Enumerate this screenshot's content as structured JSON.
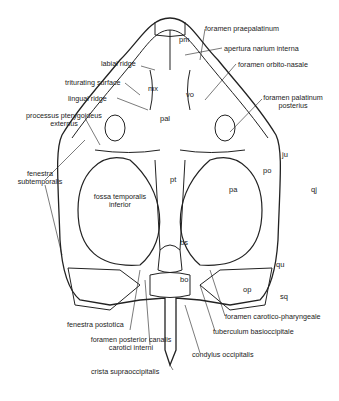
{
  "figure": {
    "labels_left": {
      "labial_ridge": "labial ridge",
      "triturating_surface": "triturating surface",
      "lingual_ridge": "lingual ridge",
      "processus_pterygoideus_1": "processus pterygoideus",
      "processus_pterygoideus_2": "externus",
      "fenestra_subtemporalis_1": "fenestra",
      "fenestra_subtemporalis_2": "subtemporalis",
      "fossa_temporalis_1": "fossa temporalis",
      "fossa_temporalis_2": "inferior",
      "fenestra_postotica": "fenestra postotica",
      "foramen_posterior_1": "foramen posterior canalis",
      "foramen_posterior_2": "carotici interni",
      "crista_supraoccipitalis": "crista supraoccipitalis"
    },
    "labels_right": {
      "foramen_praepalatinum": "foramen praepalatinum",
      "apertura_narium_interna": "apertura narium interna",
      "foramen_orbito_nasale": "foramen orbito-nasale",
      "foramen_palatinum_1": "foramen palatinum",
      "foramen_palatinum_2": "posterius",
      "foramen_carotico_pharyngeale": "foramen carotico-pharyngeale",
      "tuberculum_basioccipitale": "tuberculum basioccipitale",
      "condylus_occipitalis": "condylus occipitalis"
    },
    "bone_abbreviations": {
      "pm": "pm",
      "mx": "mx",
      "vo": "vo",
      "pal": "pal",
      "pt": "pt",
      "bs": "bs",
      "bo": "bo",
      "ju": "ju",
      "po": "po",
      "pa": "pa",
      "qj": "qj",
      "qu": "qu",
      "op": "op",
      "sq": "sq"
    }
  }
}
